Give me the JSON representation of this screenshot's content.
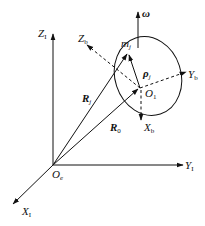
{
  "diagram": {
    "labels": {
      "Z_I": {
        "main": "Z",
        "sub": "I"
      },
      "Y_I": {
        "main": "Y",
        "sub": "I"
      },
      "X_I": {
        "main": "X",
        "sub": "I"
      },
      "O_e": {
        "main": "O",
        "sub": "e"
      },
      "O_1": {
        "main": "O",
        "sub": "1"
      },
      "Z_b": {
        "main": "Z",
        "sub": "b"
      },
      "Y_b": {
        "main": "Y",
        "sub": "b"
      },
      "X_b": {
        "main": "X",
        "sub": "b"
      },
      "m_j": {
        "main": "m",
        "sub": "j"
      },
      "R_j": {
        "main": "R",
        "sub": "j"
      },
      "R_0": {
        "main": "R",
        "sub": "0"
      },
      "rho_j": {
        "main": "ρ",
        "sub": "j"
      },
      "omega": {
        "main": "ω"
      }
    },
    "colors": {
      "stroke": "#111111",
      "background": "#ffffff"
    }
  }
}
